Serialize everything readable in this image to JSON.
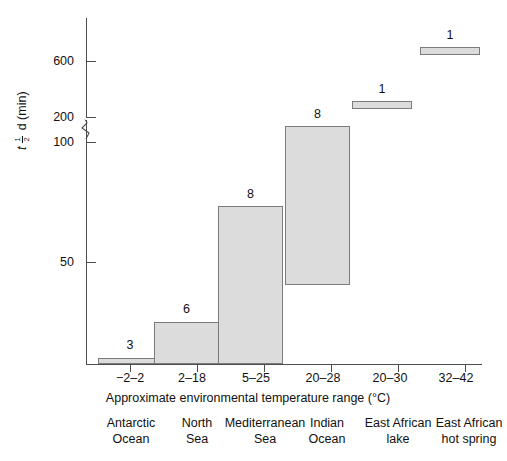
{
  "chart_data": {
    "type": "bar",
    "title": "",
    "xlabel": "Approximate environmental temperature range (°C)",
    "ylabel": "t1/2 d (min)",
    "ylabel_parts": {
      "symbol": "t",
      "num": "1",
      "den": "2",
      "rest": "d (min)"
    },
    "categories": [
      "−2–2",
      "2–18",
      "5–25",
      "20–28",
      "20–30",
      "32–42"
    ],
    "group_labels": [
      "Antarctic\nOcean",
      "North\nSea",
      "Mediterranean\nSea",
      "Indian\nOcean",
      "East African\nlake",
      "East African\nhot spring"
    ],
    "counts": [
      3,
      6,
      8,
      8,
      1,
      1
    ],
    "ranges": [
      {
        "low": 0,
        "high": 3
      },
      {
        "low": 0,
        "high": 27
      },
      {
        "low": 0,
        "high": 77
      },
      {
        "low": 42,
        "high": 190
      },
      {
        "low": 245,
        "high": 260
      },
      {
        "low": 625,
        "high": 650
      }
    ],
    "yticks": [
      50,
      100,
      200,
      600
    ],
    "ytick_labels": [
      "50",
      "100",
      "200",
      "600"
    ],
    "axis_break": true,
    "axis_break_between": [
      100,
      200
    ],
    "ylim": [
      0,
      700
    ],
    "grid": false,
    "legend": false,
    "colors": {
      "bar_fill": "#dcdcdc",
      "bar_border": "#7c7c7c",
      "axis": "#4d4d4d",
      "text": "#111111"
    }
  },
  "geometry": {
    "ytick_y": [
      262,
      142,
      117,
      61
    ],
    "bars": [
      {
        "left": 98,
        "width": 64,
        "top": 358,
        "height": 6,
        "count_top": 339,
        "count_left": 98,
        "tick_x": 130
      },
      {
        "left": 154,
        "width": 65,
        "top": 322,
        "height": 42,
        "count_top": 303,
        "count_left": 154,
        "tick_x": 197
      },
      {
        "left": 218,
        "width": 65,
        "top": 206,
        "height": 158,
        "count_top": 188,
        "count_left": 218,
        "tick_x": 264
      },
      {
        "left": 285,
        "width": 65,
        "top": 126,
        "height": 159,
        "count_top": 108,
        "count_left": 285,
        "tick_x": 331
      },
      {
        "left": 352,
        "width": 60,
        "top": 101,
        "height": 8,
        "count_top": 83,
        "count_left": 352,
        "tick_x": 398
      },
      {
        "left": 420,
        "width": 60,
        "top": 47,
        "height": 8,
        "count_top": 29,
        "count_left": 420,
        "tick_x": 465
      }
    ],
    "range_label_x": [
      98,
      160,
      224,
      291,
      358,
      424
    ],
    "cat_label_x": [
      76,
      142,
      200,
      272,
      338,
      404
    ],
    "cat_label_w": [
      110,
      110,
      130,
      110,
      120,
      130
    ]
  }
}
